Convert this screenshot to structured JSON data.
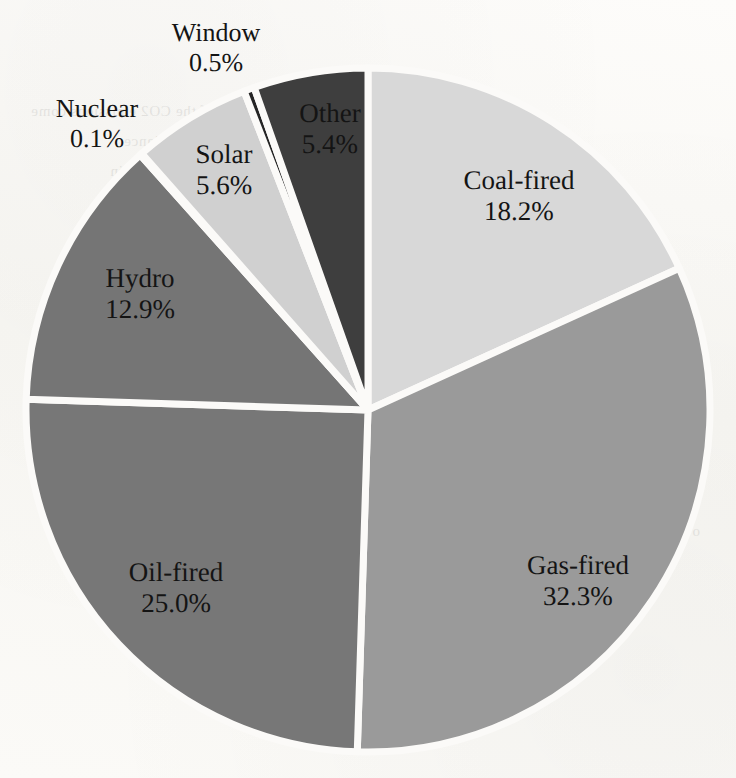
{
  "chart_data": {
    "type": "pie",
    "title": "",
    "subtitle": "",
    "xlabel": "",
    "ylabel": "",
    "legend_position": "none",
    "grid": false,
    "units": "percent",
    "start_angle_deg": 0,
    "direction": "clockwise",
    "categories": [
      "Coal-fired",
      "Gas-fired",
      "Oil-fired",
      "Hydro",
      "Nuclear",
      "Solar",
      "Window",
      "Other"
    ],
    "values": [
      18.2,
      32.3,
      25.0,
      12.9,
      0.1,
      5.6,
      0.5,
      5.4
    ],
    "slices": [
      {
        "name": "Coal-fired",
        "value": 18.2,
        "value_text": "18.2%",
        "color": "#d8d8d8",
        "label_x": 519,
        "label_y": 196,
        "label_inside": true
      },
      {
        "name": "Gas-fired",
        "value": 32.3,
        "value_text": "32.3%",
        "color": "#9a9a9a",
        "label_x": 578,
        "label_y": 581,
        "label_inside": true
      },
      {
        "name": "Oil-fired",
        "value": 25.0,
        "value_text": "25.0%",
        "color": "#777777",
        "label_x": 176,
        "label_y": 588,
        "label_inside": true
      },
      {
        "name": "Hydro",
        "value": 12.9,
        "value_text": "12.9%",
        "color": "#757575",
        "label_x": 140,
        "label_y": 294,
        "label_inside": true
      },
      {
        "name": "Nuclear",
        "value": 0.1,
        "value_text": "0.1%",
        "color": "#6f6f6f",
        "label_x": 97,
        "label_y": 124,
        "label_inside": false
      },
      {
        "name": "Solar",
        "value": 5.6,
        "value_text": "5.6%",
        "color": "#d0d0d0",
        "label_x": 224,
        "label_y": 170,
        "label_inside": true
      },
      {
        "name": "Window",
        "value": 0.5,
        "value_text": "0.5%",
        "color": "#252525",
        "label_x": 216,
        "label_y": 48,
        "label_inside": false
      },
      {
        "name": "Other",
        "value": 5.4,
        "value_text": "5.4%",
        "color": "#3e3e3e",
        "label_x": 330,
        "label_y": 129,
        "label_inside": true
      }
    ],
    "geometry": {
      "center_x": 368,
      "center_y": 410,
      "radius": 342,
      "separator_color": "#fbfaf8",
      "separator_width": 7
    }
  },
  "page": {
    "background_color": "#fbfaf8",
    "text_color": "#141414",
    "bleed_through_lines": [
      {
        "text": "a very large part of the CO2 emissions come",
        "x": 408,
        "y": 96
      },
      {
        "text": "from power generation and the balance",
        "x": 352,
        "y": 126
      },
      {
        "text": "of the supply mix is a key factor in",
        "x": 392,
        "y": 156
      },
      {
        "text": "determining overall carbon intensity",
        "x": 372,
        "y": 186
      },
      {
        "text": "of electricity supplied to consumers",
        "x": 416,
        "y": 216
      },
      {
        "text": "the share of renewable capacity",
        "x": 436,
        "y": 246
      },
      {
        "text": "remains comparatively modest",
        "x": 60,
        "y": 432
      },
      {
        "text": "over the period considered",
        "x": 36,
        "y": 516
      }
    ]
  }
}
